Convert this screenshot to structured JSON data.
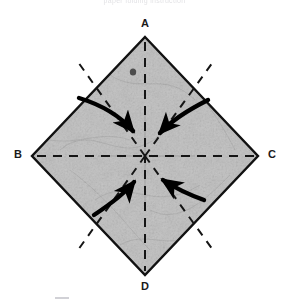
{
  "figure": {
    "caption_top": "paper folding instruction",
    "title_visible": false
  },
  "labels": {
    "a": "A",
    "b": "B",
    "c": "C",
    "d": "D"
  },
  "colors": {
    "paper_fill": "#c9c9c9",
    "paper_edge": "#111111",
    "fold_line": "#1a1a1a",
    "arrow": "#000000",
    "label_text": "#1a1a1a",
    "background": "#ffffff"
  },
  "diagram": {
    "type": "origami-fold-step",
    "shape": "square rotated 45 degrees (diamond)",
    "vertices": [
      {
        "name": "A",
        "position": "top",
        "x": 145,
        "y": 37
      },
      {
        "name": "B",
        "position": "left",
        "x": 32,
        "y": 156
      },
      {
        "name": "C",
        "position": "right",
        "x": 258,
        "y": 156
      },
      {
        "name": "D",
        "position": "bottom",
        "x": 145,
        "y": 275
      }
    ],
    "fold_lines": [
      {
        "name": "horizontal-crease",
        "from": "B",
        "to": "C",
        "style": "dashed"
      },
      {
        "name": "vertical-crease",
        "from": "A",
        "to": "D",
        "style": "dashed"
      },
      {
        "name": "diagonal-crease-upper-left",
        "from": "center",
        "to": "left-upper-edge",
        "style": "dashed"
      },
      {
        "name": "diagonal-crease-upper-right",
        "from": "center",
        "to": "right-upper-edge",
        "style": "dashed"
      },
      {
        "name": "diagonal-crease-lower-left",
        "from": "center",
        "to": "left-lower-edge",
        "style": "dashed"
      },
      {
        "name": "diagonal-crease-lower-right",
        "from": "center",
        "to": "right-lower-edge",
        "style": "dashed"
      }
    ],
    "arrows": [
      {
        "name": "arrow-from-upper-left",
        "direction": "down-right",
        "points_to": "center"
      },
      {
        "name": "arrow-from-upper-right",
        "direction": "down-left",
        "points_to": "center"
      },
      {
        "name": "arrow-from-lower-left",
        "direction": "up-right",
        "points_to": "center"
      },
      {
        "name": "arrow-from-lower-right",
        "direction": "up-left",
        "points_to": "center"
      }
    ],
    "marks": [
      {
        "name": "ink-spot",
        "x": 133,
        "y": 72
      }
    ]
  }
}
